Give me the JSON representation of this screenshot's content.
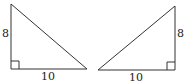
{
  "figure": {
    "triangles": [
      {
        "name": "left-triangle",
        "vertical_leg": "8",
        "horizontal_leg": "10",
        "right_angle_corner": "bottom-left"
      },
      {
        "name": "right-triangle",
        "vertical_leg": "8",
        "horizontal_leg": "10",
        "right_angle_corner": "bottom-right"
      }
    ],
    "stroke_color": "#333333"
  }
}
